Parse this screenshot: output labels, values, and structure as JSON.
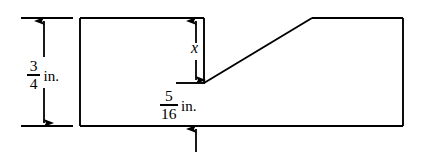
{
  "figure": {
    "background_color": "#ffffff",
    "line_color": "#000000",
    "dimensions": {
      "overall_height": {
        "numerator": "3",
        "denominator": "4",
        "unit": "in.",
        "icon": "double-headed-vertical-arrow-icon"
      },
      "notch_depth": {
        "label": "x",
        "icon": "double-headed-vertical-arrow-icon"
      },
      "remaining_thickness": {
        "numerator": "5",
        "denominator": "16",
        "unit": "in.",
        "icon": "up-arrow-icon"
      }
    },
    "outline": {
      "type": "polygon",
      "description": "Rectangular bar with a rectangular notch cut from the top whose right side opens into an inclined ramp rising back to the top edge",
      "points": "80,18 204,18 204,83 312,18 403,18 403,126 80,126"
    }
  }
}
